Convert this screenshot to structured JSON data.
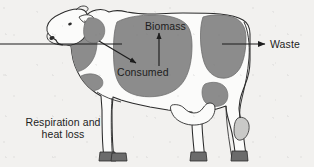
{
  "diagram": {
    "background_color": "#f2f1ef",
    "outline_color": "#2b2b2b",
    "patch_color": "#8c8c8c",
    "hoof_color": "#6b6b6b",
    "text_color": "#1d1d1d"
  },
  "labels": {
    "biomass": "Biomass",
    "consumed": "Consumed",
    "waste": "Waste",
    "respiration": "Respiration and heat loss"
  },
  "arrows": [
    {
      "name": "intake-arrow",
      "label": "",
      "direction": "right",
      "from": [
        0,
        44
      ],
      "to": [
        120,
        44
      ],
      "description": "input line entering at the cow's mouth"
    },
    {
      "name": "consumed-arrow",
      "label": "Consumed",
      "direction": "down-right",
      "from": [
        100,
        42
      ],
      "to": [
        137,
        64
      ],
      "description": "arrow pointing into the body mass region"
    },
    {
      "name": "biomass-arrow",
      "label": "Biomass",
      "direction": "up",
      "from": [
        159,
        66
      ],
      "to": [
        159,
        34
      ],
      "description": "arrow pointing up out of the body"
    },
    {
      "name": "waste-arrow",
      "label": "Waste",
      "direction": "right",
      "from": [
        222,
        44
      ],
      "to": [
        266,
        44
      ],
      "description": "arrow exiting at the rear of the cow"
    }
  ]
}
